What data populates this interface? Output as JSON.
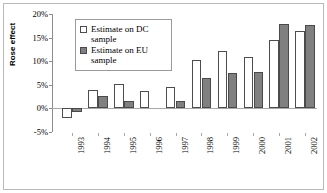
{
  "chart_data": {
    "type": "bar",
    "title": "",
    "xlabel": "",
    "ylabel": "Rose effect",
    "categories": [
      "1993",
      "1994",
      "1995",
      "1996",
      "1997",
      "1998",
      "1999",
      "2000",
      "2001",
      "2002"
    ],
    "ylim": [
      -5,
      20
    ],
    "ytick_labels": [
      "20%",
      "15%",
      "10%",
      "5%",
      "0%",
      "-5%"
    ],
    "ytick_values": [
      20,
      15,
      10,
      5,
      0,
      -5
    ],
    "grid": false,
    "legend_position": "upper-left-inside",
    "series": [
      {
        "name": "Estimate on DC sample",
        "color": "#ffffff",
        "edge_color": "#4d4d4d",
        "values": [
          -2.0,
          3.8,
          5.1,
          3.6,
          4.5,
          10.2,
          12.2,
          10.9,
          14.4,
          16.5
        ]
      },
      {
        "name": "Estimate on EU sample",
        "color": "#808080",
        "edge_color": "#4a4a4a",
        "values": [
          -0.7,
          2.6,
          1.5,
          null,
          1.6,
          6.5,
          7.5,
          7.7,
          17.9,
          17.7
        ]
      }
    ]
  },
  "legend": {
    "entries": [
      {
        "label": "Estimate on DC sample",
        "swatch": "dc"
      },
      {
        "label": "Estimate on EU sample",
        "swatch": "eu"
      }
    ]
  }
}
